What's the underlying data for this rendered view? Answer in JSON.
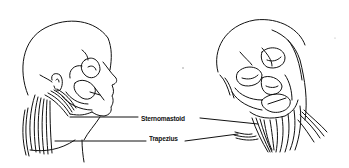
{
  "figure": {
    "type": "anatomical-line-drawing",
    "views": [
      "side-profile-head",
      "tilted-front-head"
    ],
    "labels": [
      {
        "id": "sternomastoid",
        "text": "Sternomastoid"
      },
      {
        "id": "trapezius",
        "text": "Trapezius"
      }
    ],
    "colors": {
      "ink": "#111111",
      "background": "#ffffff"
    }
  }
}
